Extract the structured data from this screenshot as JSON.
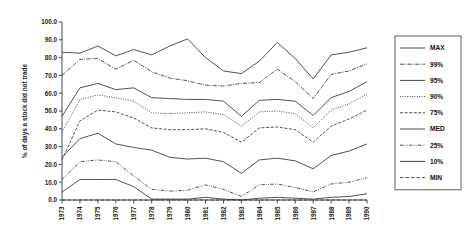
{
  "chart_data": {
    "type": "line",
    "title": "",
    "xlabel": "",
    "ylabel": "% of days a stock did not trade",
    "ylim": [
      0.0,
      100.0
    ],
    "yticks": [
      "0.0",
      "10.0",
      "20.0",
      "30.0",
      "40.0",
      "50.0",
      "60.0",
      "70.0",
      "80.0",
      "90.0",
      "100.0"
    ],
    "grid": false,
    "legend_position": "right",
    "categories": [
      "1973",
      "1974",
      "1975",
      "1976",
      "1977",
      "1978",
      "1979",
      "1980",
      "1981",
      "1982",
      "1983",
      "1984",
      "1985",
      "1986",
      "1987",
      "1988",
      "1989",
      "1990"
    ],
    "series": [
      {
        "name": "MAX",
        "dash": "solid",
        "values": [
          83.0,
          82.5,
          86.5,
          81.0,
          84.5,
          81.5,
          86.5,
          90.5,
          80.0,
          72.5,
          71.0,
          78.0,
          88.5,
          79.5,
          68.0,
          81.5,
          83.0,
          85.5
        ]
      },
      {
        "name": "99%",
        "dash": "dashdot",
        "values": [
          70.0,
          79.0,
          79.5,
          73.5,
          78.5,
          72.0,
          68.5,
          67.0,
          64.5,
          64.0,
          65.5,
          66.0,
          73.5,
          66.5,
          57.0,
          70.5,
          72.5,
          76.5
        ]
      },
      {
        "name": "95%",
        "dash": "solid",
        "values": [
          47.0,
          63.0,
          65.5,
          62.0,
          63.0,
          57.5,
          57.0,
          56.5,
          56.5,
          55.5,
          47.0,
          56.0,
          56.5,
          55.5,
          47.5,
          57.5,
          61.0,
          66.5
        ]
      },
      {
        "name": "90%",
        "dash": "dotted",
        "values": [
          38.0,
          56.5,
          59.0,
          57.5,
          55.5,
          49.0,
          48.5,
          49.0,
          49.5,
          48.0,
          41.5,
          49.5,
          50.0,
          48.5,
          40.5,
          50.5,
          54.0,
          59.5
        ]
      },
      {
        "name": "75%",
        "dash": "dashed",
        "values": [
          22.5,
          44.5,
          50.5,
          49.5,
          46.0,
          40.5,
          39.5,
          39.5,
          40.0,
          38.0,
          32.5,
          40.5,
          41.0,
          39.5,
          32.5,
          41.5,
          45.5,
          50.5
        ]
      },
      {
        "name": "MED",
        "dash": "solid",
        "values": [
          24.0,
          34.5,
          37.5,
          31.5,
          29.5,
          28.0,
          24.0,
          23.0,
          23.5,
          21.5,
          15.0,
          22.5,
          23.5,
          22.0,
          17.5,
          25.0,
          27.5,
          31.5
        ]
      },
      {
        "name": "25%",
        "dash": "dashdotdot",
        "values": [
          11.5,
          21.5,
          22.5,
          21.5,
          13.5,
          6.0,
          5.0,
          5.5,
          8.5,
          6.0,
          2.0,
          8.5,
          9.0,
          7.0,
          4.5,
          9.0,
          10.0,
          12.5
        ]
      },
      {
        "name": "10%",
        "dash": "solid",
        "values": [
          4.5,
          11.5,
          11.5,
          11.5,
          7.5,
          0.5,
          0.5,
          0.5,
          1.5,
          0.5,
          0.0,
          1.0,
          1.5,
          1.0,
          0.5,
          1.5,
          2.0,
          3.5
        ]
      },
      {
        "name": "MIN",
        "dash": "dashed2",
        "values": [
          0.0,
          0.0,
          0.0,
          0.0,
          0.0,
          0.0,
          0.0,
          0.0,
          0.0,
          0.0,
          0.0,
          0.0,
          0.0,
          0.0,
          0.0,
          0.0,
          0.0,
          0.0
        ]
      }
    ]
  }
}
